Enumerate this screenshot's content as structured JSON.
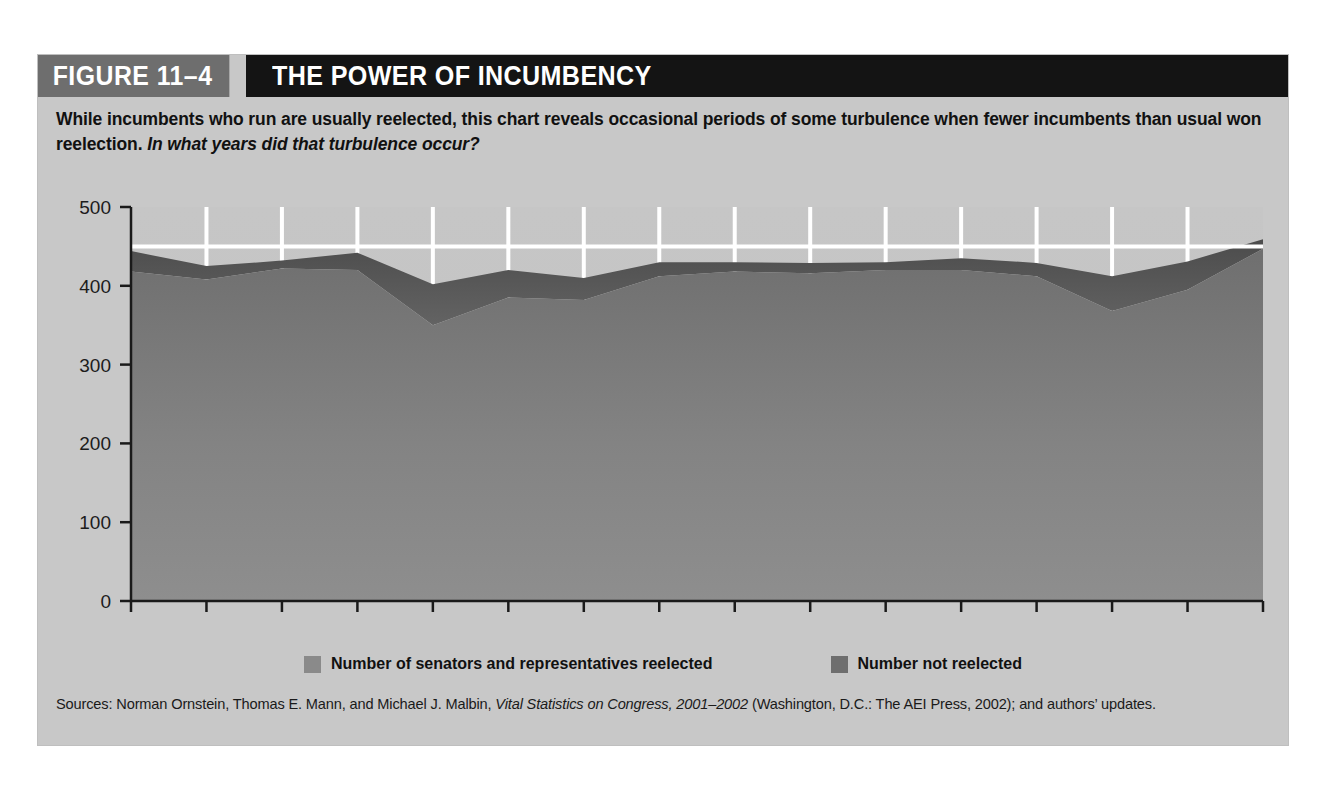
{
  "figure": {
    "number_label": "FIGURE 11–4",
    "title": "THE POWER OF INCUMBENCY",
    "subtitle_main": "While incumbents who run are usually reelected, this chart reveals occasional periods of some turbulence when fewer incumbents than usual won reelection.",
    "subtitle_question": "In what years did that turbulence occur?",
    "source_prefix": "Sources: Norman Ornstein, Thomas E. Mann, and Michael J. Malbin, ",
    "source_italic": "Vital Statistics on Congress, 2001–2002",
    "source_suffix": " (Washington, D.C.: The AEI Press, 2002); and authors’ updates."
  },
  "colors": {
    "figure_background": "#c8c8c8",
    "header_number_bg": "#6e6e6e",
    "header_title_bg": "#141414",
    "plot_background": "#c3c3c3",
    "series_reelected": "#8a8a8a",
    "series_not_reelected": "#565656",
    "gridline": "#ffffff",
    "axis": "#1a1a1a",
    "text": "#111111"
  },
  "legend": {
    "position": "bottom-center",
    "items": [
      {
        "label": "Number of senators and representatives reelected",
        "color": "#8a8a8a"
      },
      {
        "label": "Number not reelected",
        "color": "#6e6e6e"
      }
    ]
  },
  "chart_data": {
    "type": "area",
    "stacked": true,
    "title": "THE POWER OF INCUMBENCY",
    "xlabel": "",
    "ylabel": "",
    "xlim": [
      1984,
      2014
    ],
    "ylim": [
      0,
      500
    ],
    "grid": "white vertical gridlines every 2 years plus horizontal gridline at 450",
    "y_ticks": [
      0,
      100,
      200,
      300,
      400,
      500
    ],
    "y_tick_labels": [
      "0",
      "100",
      "200",
      "300",
      "400",
      "500"
    ],
    "x_ticks": [
      1984,
      1986,
      1988,
      1990,
      1992,
      1994,
      1996,
      1998,
      2000,
      2002,
      2004,
      2006,
      2008,
      2010,
      2012,
      2014
    ],
    "x_tick_labels": [
      "1984",
      "1986",
      "1988",
      "1990",
      "1992",
      "1994",
      "1996",
      "1998",
      "2000",
      "2002",
      "2004",
      "2006",
      "2008",
      "2010",
      "2012",
      "2014"
    ],
    "gridline_horizontal_at": 450,
    "x": [
      1984,
      1986,
      1988,
      1990,
      1992,
      1994,
      1996,
      1998,
      2000,
      2002,
      2004,
      2006,
      2008,
      2010,
      2012,
      2014
    ],
    "series": [
      {
        "name": "Number of senators and representatives reelected",
        "color": "#8a8a8a",
        "values": [
          418,
          408,
          422,
          420,
          350,
          385,
          382,
          412,
          418,
          416,
          420,
          420,
          412,
          368,
          395,
          447
        ]
      },
      {
        "name": "Number not reelected",
        "color": "#565656",
        "values": [
          26,
          17,
          10,
          22,
          52,
          35,
          28,
          18,
          12,
          13,
          10,
          15,
          17,
          44,
          36,
          12
        ]
      }
    ],
    "totals": [
      444,
      425,
      432,
      442,
      402,
      420,
      410,
      430,
      430,
      429,
      430,
      435,
      429,
      412,
      431,
      459
    ]
  }
}
